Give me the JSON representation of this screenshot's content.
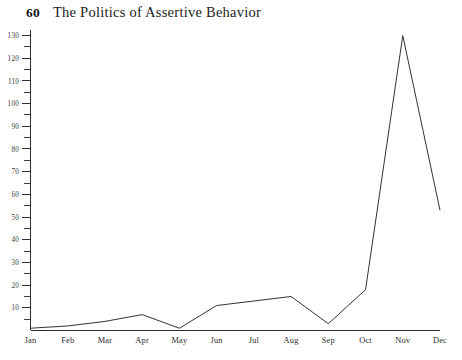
{
  "running_head": {
    "page_number": "60",
    "title": "The Politics of Assertive Behavior"
  },
  "chart_data": {
    "type": "line",
    "title": "",
    "subtitle": "",
    "xlabel": "",
    "ylabel": "",
    "categories": [
      "Jan",
      "Feb",
      "Mar",
      "Apr",
      "May",
      "Jun",
      "Jul",
      "Aug",
      "Sep",
      "Oct",
      "Nov",
      "Dec"
    ],
    "values": [
      1,
      2,
      4,
      7,
      1,
      11,
      13,
      15,
      3,
      18,
      130,
      53
    ],
    "series": [
      {
        "name": "",
        "values": [
          1,
          2,
          4,
          7,
          1,
          11,
          13,
          15,
          3,
          18,
          130,
          53
        ]
      }
    ],
    "ylim": [
      0,
      132
    ],
    "xlim": [
      0,
      11
    ],
    "y_major_ticks": [
      10,
      20,
      30,
      40,
      50,
      60,
      70,
      80,
      90,
      100,
      110,
      120,
      130
    ],
    "y_major_tick_labels": [
      "10",
      "20",
      "30",
      "40",
      "50",
      "60",
      "70",
      "80",
      "90",
      "100",
      "110",
      "120",
      "130"
    ],
    "y_minor_ticks": [
      5,
      15,
      25,
      35,
      45,
      55,
      65,
      75,
      85,
      95,
      105,
      115,
      125
    ],
    "grid": false,
    "legend": false,
    "legend_position": "none",
    "line_color": "#333333",
    "axis_color": "#2e2e2e",
    "background_color": "#ffffff"
  }
}
